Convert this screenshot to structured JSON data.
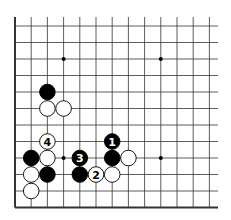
{
  "diagram": {
    "type": "go-board-fragment",
    "columns": 13,
    "rows": 12,
    "edges": [
      "left",
      "bottom"
    ],
    "colors": {
      "black": "#000000",
      "white": "#ffffff",
      "line": "#333333",
      "background": "#ffffff"
    },
    "hoshi": [
      {
        "col": 3,
        "row": 2
      },
      {
        "col": 9,
        "row": 2
      },
      {
        "col": 3,
        "row": 8
      },
      {
        "col": 9,
        "row": 8
      }
    ],
    "stones": [
      {
        "color": "black",
        "col": 2,
        "row": 4,
        "label": ""
      },
      {
        "color": "white",
        "col": 2,
        "row": 5,
        "label": ""
      },
      {
        "color": "white",
        "col": 3,
        "row": 5,
        "label": ""
      },
      {
        "color": "white",
        "col": 2,
        "row": 7,
        "label": "4"
      },
      {
        "color": "black",
        "col": 1,
        "row": 8,
        "label": ""
      },
      {
        "color": "white",
        "col": 2,
        "row": 8,
        "label": ""
      },
      {
        "color": "black",
        "col": 4,
        "row": 8,
        "label": "3"
      },
      {
        "color": "black",
        "col": 6,
        "row": 7,
        "label": "1"
      },
      {
        "color": "black",
        "col": 6,
        "row": 8,
        "label": ""
      },
      {
        "color": "white",
        "col": 7,
        "row": 8,
        "label": ""
      },
      {
        "color": "white",
        "col": 1,
        "row": 9,
        "label": ""
      },
      {
        "color": "black",
        "col": 2,
        "row": 9,
        "label": ""
      },
      {
        "color": "black",
        "col": 4,
        "row": 9,
        "label": ""
      },
      {
        "color": "white",
        "col": 5,
        "row": 9,
        "label": "2"
      },
      {
        "color": "white",
        "col": 6,
        "row": 9,
        "label": ""
      },
      {
        "color": "white",
        "col": 1,
        "row": 10,
        "label": ""
      }
    ]
  }
}
